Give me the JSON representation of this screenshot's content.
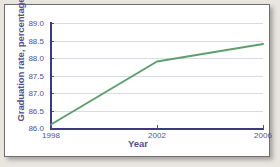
{
  "figure": {
    "background_color": "#e9e6e0",
    "card_color": "#ffffff",
    "frame_color": "#6e6e74"
  },
  "chart_data": {
    "type": "line",
    "title": "",
    "xlabel": "Year",
    "ylabel": "Graduation rate, percentage",
    "x": [
      1998,
      2002,
      2006
    ],
    "values": [
      86.1,
      87.9,
      88.4
    ],
    "series": [
      {
        "name": "Graduation rate",
        "values": [
          86.1,
          87.9,
          88.4
        ],
        "color": "#5f9e6e"
      }
    ],
    "xticklabels": [
      "1998",
      "2002",
      "2006"
    ],
    "yticklabels": [
      "86.0",
      "86.5",
      "87.0",
      "87.5",
      "88.0",
      "88.5",
      "89.0"
    ],
    "yticks": [
      86.0,
      86.5,
      87.0,
      87.5,
      88.0,
      88.5,
      89.0
    ],
    "xlim": [
      1998,
      2006
    ],
    "ylim": [
      86.0,
      89.0
    ],
    "grid": "horizontal",
    "legend": "none",
    "axis_color": "#3e3a79",
    "label_color": "#514f8e",
    "gridline_color": "#d7dce6",
    "line_color": "#5f9e6e"
  }
}
